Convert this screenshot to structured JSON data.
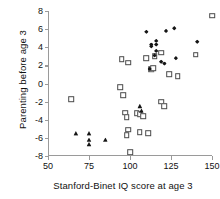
{
  "chart_data": {
    "type": "scatter",
    "title": "",
    "xlabel": "Stanford-Binet IQ score at age 3",
    "ylabel": "Parenting before age 3",
    "xlim": [
      50,
      150
    ],
    "ylim": [
      -8,
      8
    ],
    "xticks": [
      50,
      75,
      100,
      125,
      150
    ],
    "yticks": [
      -8,
      -6,
      -4,
      -2,
      0,
      2,
      4,
      6,
      8
    ],
    "xtick_labels": [
      "50",
      "75",
      "100",
      "125",
      "150"
    ],
    "ytick_labels": [
      "-8",
      "-6",
      "-4",
      "-2",
      "0",
      "2",
      "4",
      "6",
      "8"
    ],
    "grid": false,
    "legend": "none",
    "series": [
      {
        "name": "open-square",
        "marker": "open-square",
        "color": "#4a4a4a",
        "points": [
          [
            64,
            -1.7
          ],
          [
            95,
            2.7
          ],
          [
            99,
            2.3
          ],
          [
            94,
            -0.4
          ],
          [
            96,
            -1.3
          ],
          [
            97,
            -3.2
          ],
          [
            98,
            -3.7
          ],
          [
            99,
            -5.1
          ],
          [
            98,
            -5.7
          ],
          [
            100,
            -7.6
          ],
          [
            104,
            -3.3
          ],
          [
            106,
            -3.4
          ],
          [
            108,
            -3.6
          ],
          [
            106,
            -5.4
          ],
          [
            111,
            -5.5
          ],
          [
            113,
            1.6
          ],
          [
            114,
            1.7
          ],
          [
            110,
            2.8
          ],
          [
            115,
            3.0
          ],
          [
            119,
            3.4
          ],
          [
            119,
            -2.0
          ],
          [
            121,
            -2.5
          ],
          [
            124,
            1.0
          ],
          [
            129,
            0.8
          ],
          [
            140,
            3.2
          ],
          [
            150,
            7.5
          ]
        ]
      },
      {
        "name": "filled-diamond",
        "marker": "filled-diamond",
        "color": "#151515",
        "points": [
          [
            110,
            5.7
          ],
          [
            113,
            4.3
          ],
          [
            113,
            4.1
          ],
          [
            116,
            4.7
          ],
          [
            116,
            4.3
          ],
          [
            112,
            1.6
          ],
          [
            115,
            3.1
          ],
          [
            116,
            3.6
          ],
          [
            119,
            2.4
          ],
          [
            122,
            5.8
          ],
          [
            127,
            6.1
          ],
          [
            128,
            2.8
          ],
          [
            121,
            2.2
          ],
          [
            141,
            4.6
          ]
        ]
      },
      {
        "name": "filled-triangle",
        "marker": "filled-triangle",
        "color": "#151515",
        "points": [
          [
            67,
            -5.5
          ],
          [
            75,
            -5.5
          ],
          [
            75,
            -6.2
          ],
          [
            75,
            -6.7
          ],
          [
            85,
            -6.2
          ],
          [
            106,
            -2.5
          ],
          [
            107,
            -3.0
          ]
        ]
      }
    ]
  }
}
